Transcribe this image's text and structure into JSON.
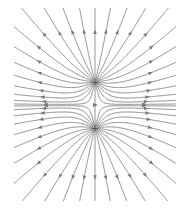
{
  "diagram": {
    "charges": [
      {
        "id": "top-charge",
        "x": 95,
        "y": 82,
        "q": 1,
        "sign": "+"
      },
      {
        "id": "bottom-charge",
        "x": 95,
        "y": 128,
        "q": 1,
        "sign": "+"
      }
    ],
    "lines_per_charge": 26,
    "clip": {
      "x0": 14,
      "y0": 8,
      "x1": 176,
      "y1": 201
    },
    "colors": {
      "line": "#8a8a8a",
      "arrow": "#7a7a7a",
      "background": "#ffffff"
    }
  }
}
